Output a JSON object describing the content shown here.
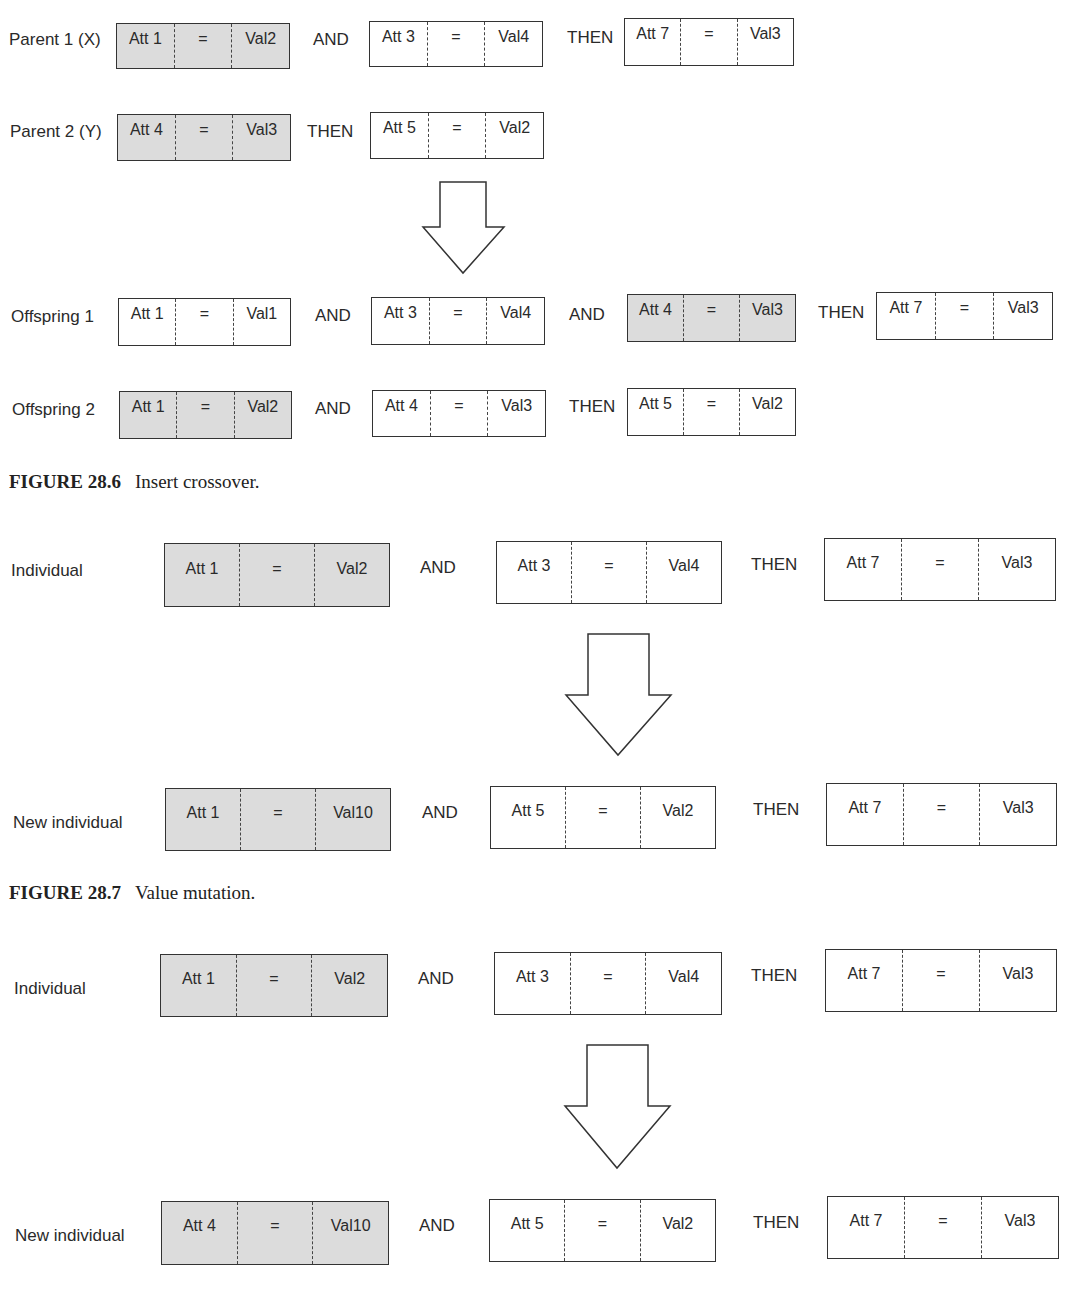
{
  "figure_28_6": {
    "caption_number": "FIGURE 28.6",
    "caption_text": "Insert crossover.",
    "rows": [
      {
        "label": "Parent 1 (X)",
        "items": [
          {
            "type": "cond",
            "att": "Att 1",
            "op": "=",
            "val": "Val2",
            "shaded": true
          },
          {
            "type": "conn",
            "text": "AND"
          },
          {
            "type": "cond",
            "att": "Att 3",
            "op": "=",
            "val": "Val4",
            "shaded": false
          },
          {
            "type": "conn",
            "text": "THEN"
          },
          {
            "type": "cond",
            "att": "Att 7",
            "op": "=",
            "val": "Val3",
            "shaded": false
          }
        ]
      },
      {
        "label": "Parent 2 (Y)",
        "items": [
          {
            "type": "cond",
            "att": "Att 4",
            "op": "=",
            "val": "Val3",
            "shaded": true
          },
          {
            "type": "conn",
            "text": "THEN"
          },
          {
            "type": "cond",
            "att": "Att 5",
            "op": "=",
            "val": "Val2",
            "shaded": false
          }
        ]
      },
      {
        "label": "Offspring 1",
        "items": [
          {
            "type": "cond",
            "att": "Att 1",
            "op": "=",
            "val": "Val1",
            "shaded": false
          },
          {
            "type": "conn",
            "text": "AND"
          },
          {
            "type": "cond",
            "att": "Att 3",
            "op": "=",
            "val": "Val4",
            "shaded": false
          },
          {
            "type": "conn",
            "text": "AND"
          },
          {
            "type": "cond",
            "att": "Att 4",
            "op": "=",
            "val": "Val3",
            "shaded": true
          },
          {
            "type": "conn",
            "text": "THEN"
          },
          {
            "type": "cond",
            "att": "Att 7",
            "op": "=",
            "val": "Val3",
            "shaded": false
          }
        ]
      },
      {
        "label": "Offspring 2",
        "items": [
          {
            "type": "cond",
            "att": "Att 1",
            "op": "=",
            "val": "Val2",
            "shaded": true
          },
          {
            "type": "conn",
            "text": "AND"
          },
          {
            "type": "cond",
            "att": "Att 4",
            "op": "=",
            "val": "Val3",
            "shaded": false
          },
          {
            "type": "conn",
            "text": "THEN"
          },
          {
            "type": "cond",
            "att": "Att 5",
            "op": "=",
            "val": "Val2",
            "shaded": false
          }
        ]
      }
    ]
  },
  "figure_28_7": {
    "caption_number": "FIGURE 28.7",
    "caption_text": "Value mutation.",
    "rows": [
      {
        "label": "Individual",
        "items": [
          {
            "type": "cond",
            "att": "Att 1",
            "op": "=",
            "val": "Val2",
            "shaded": true
          },
          {
            "type": "conn",
            "text": "AND"
          },
          {
            "type": "cond",
            "att": "Att 3",
            "op": "=",
            "val": "Val4",
            "shaded": false
          },
          {
            "type": "conn",
            "text": "THEN"
          },
          {
            "type": "cond",
            "att": "Att 7",
            "op": "=",
            "val": "Val3",
            "shaded": false
          }
        ]
      },
      {
        "label": "New individual",
        "items": [
          {
            "type": "cond",
            "att": "Att 1",
            "op": "=",
            "val": "Val10",
            "shaded": true
          },
          {
            "type": "conn",
            "text": "AND"
          },
          {
            "type": "cond",
            "att": "Att 5",
            "op": "=",
            "val": "Val2",
            "shaded": false
          },
          {
            "type": "conn",
            "text": "THEN"
          },
          {
            "type": "cond",
            "att": "Att 7",
            "op": "=",
            "val": "Val3",
            "shaded": false
          }
        ]
      }
    ]
  },
  "figure_3": {
    "rows": [
      {
        "label": "Individual",
        "items": [
          {
            "type": "cond",
            "att": "Att 1",
            "op": "=",
            "val": "Val2",
            "shaded": true
          },
          {
            "type": "conn",
            "text": "AND"
          },
          {
            "type": "cond",
            "att": "Att 3",
            "op": "=",
            "val": "Val4",
            "shaded": false
          },
          {
            "type": "conn",
            "text": "THEN"
          },
          {
            "type": "cond",
            "att": "Att 7",
            "op": "=",
            "val": "Val3",
            "shaded": false
          }
        ]
      },
      {
        "label": "New individual",
        "items": [
          {
            "type": "cond",
            "att": "Att 4",
            "op": "=",
            "val": "Val10",
            "shaded": true
          },
          {
            "type": "conn",
            "text": "AND"
          },
          {
            "type": "cond",
            "att": "Att 5",
            "op": "=",
            "val": "Val2",
            "shaded": false
          },
          {
            "type": "conn",
            "text": "THEN"
          },
          {
            "type": "cond",
            "att": "Att 7",
            "op": "=",
            "val": "Val3",
            "shaded": false
          }
        ]
      }
    ]
  }
}
